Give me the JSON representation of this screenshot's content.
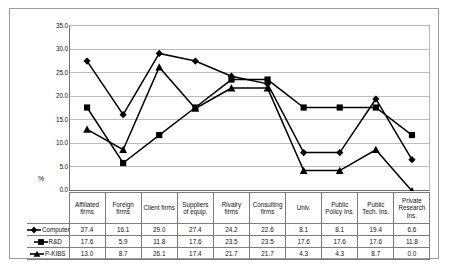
{
  "chart_data": {
    "type": "line",
    "title": "",
    "xlabel": "",
    "ylabel": "%",
    "ylim": [
      0.0,
      35.0
    ],
    "ytick_step": 5.0,
    "yticks": [
      "35.0",
      "30.0",
      "25.0",
      "20.0",
      "15.0",
      "10.0",
      "5.0",
      "0.0"
    ],
    "grid": "horizontal",
    "legend_position": "table-left",
    "categories": [
      "Affiliated firms",
      "Foreign firms",
      "Client firms",
      "Suppliers of equip.",
      "Rivalry firms",
      "Consulting firms",
      "Univ.",
      "Public Policy Ins.",
      "Public Tech. Ins.",
      "Private Research Ins."
    ],
    "series": [
      {
        "name": "Computer",
        "marker": "diamond",
        "values": [
          27.4,
          16.1,
          29.0,
          27.4,
          24.2,
          22.6,
          8.1,
          8.1,
          19.4,
          6.6
        ],
        "labels": [
          "27.4",
          "16.1",
          "29.0",
          "27.4",
          "24.2",
          "22.6",
          "8.1",
          "8.1",
          "19.4",
          "6.6"
        ]
      },
      {
        "name": "R&D",
        "marker": "square",
        "values": [
          17.6,
          5.9,
          11.8,
          17.6,
          23.5,
          23.5,
          17.6,
          17.6,
          17.6,
          11.8
        ],
        "labels": [
          "17.6",
          "5.9",
          "11.8",
          "17.6",
          "23.5",
          "23.5",
          "17.6",
          "17.6",
          "17.6",
          "11.8"
        ]
      },
      {
        "name": "P-KIBS",
        "marker": "triangle",
        "values": [
          13.0,
          8.7,
          26.1,
          17.4,
          21.7,
          21.7,
          4.3,
          4.3,
          8.7,
          0.0
        ],
        "labels": [
          "13.0",
          "8.7",
          "26.1",
          "17.4",
          "21.7",
          "21.7",
          "4.3",
          "4.3",
          "8.7",
          "0.0"
        ]
      }
    ],
    "colors": {
      "series_line": "#000000",
      "gridline": "#bcbcbc",
      "axis": "#6f6f6f",
      "frame": "#9a9a9a",
      "background": "#ffffff"
    }
  }
}
